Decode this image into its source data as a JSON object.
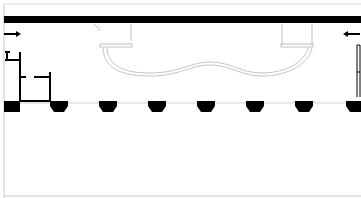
{
  "diagram": {
    "type": "floor-plan",
    "colors": {
      "wall": "#000000",
      "light_line": "#c8c8c8",
      "border": "#bdbdbd",
      "background": "#ffffff"
    },
    "arrows": [
      {
        "id": "left",
        "direction": "right"
      },
      {
        "id": "right",
        "direction": "left"
      }
    ],
    "column_blocks_count": 8,
    "conveyor": "curved track between two top fixtures"
  }
}
